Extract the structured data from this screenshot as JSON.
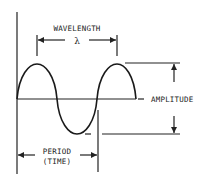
{
  "diagram": {
    "labels": {
      "wavelength": "WAVELENGTH",
      "lambda": "λ",
      "amplitude": "AMPLITUDE",
      "period_line1": "PERIOD",
      "period_line2": "(TIME)"
    },
    "colors": {
      "stroke": "#222222",
      "background": "#ffffff"
    }
  }
}
